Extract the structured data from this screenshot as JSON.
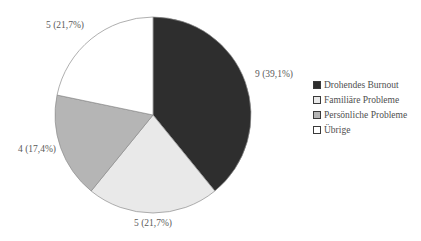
{
  "chart_data": {
    "type": "pie",
    "title": "",
    "total": 23,
    "start_angle_deg": -90,
    "direction": "clockwise",
    "legend_position": "right",
    "background_color": "#ffffff",
    "slice_border_color": "#8c8c8c",
    "label_color": "#5a5a5a",
    "legend_text_color": "#4f4f4f",
    "slices": [
      {
        "name": "Drohendes Burnout",
        "value": 9,
        "pct": "39,1%",
        "label": "9 (39,1%)",
        "color": "#2e2e2e"
      },
      {
        "name": "Familiäre Probleme",
        "value": 5,
        "pct": "21,7%",
        "label": "5 (21,7%)",
        "color": "#e9e9e9"
      },
      {
        "name": "Persönliche Probleme",
        "value": 4,
        "pct": "17,4%",
        "label": "4 (17,4%)",
        "color": "#b5b5b5"
      },
      {
        "name": "Übrige",
        "value": 5,
        "pct": "21,7%",
        "label": "5 (21,7%)",
        "color": "#ffffff"
      }
    ]
  }
}
